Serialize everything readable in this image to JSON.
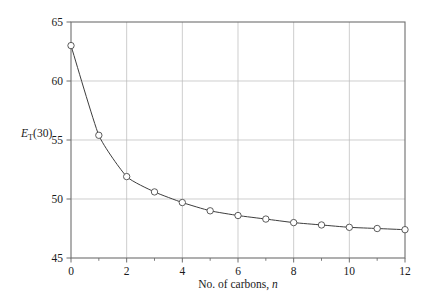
{
  "chart_data": {
    "type": "line",
    "title": "",
    "xlabel": "No. of carbons, n",
    "ylabel": "ET(30)",
    "ylabel_parts": {
      "symbol": "E",
      "subscript": "T",
      "suffix": "(30)"
    },
    "xlabel_parts": {
      "text": "No. of carbons,",
      "italic": "n"
    },
    "x": [
      0,
      1,
      2,
      3,
      4,
      5,
      6,
      7,
      8,
      9,
      10,
      11,
      12
    ],
    "values": [
      63.0,
      55.4,
      51.9,
      50.6,
      49.7,
      49.0,
      48.6,
      48.3,
      48.0,
      47.8,
      47.6,
      47.5,
      47.4
    ],
    "series": [
      {
        "name": "ET(30)",
        "values": [
          63.0,
          55.4,
          51.9,
          50.6,
          49.7,
          49.0,
          48.6,
          48.3,
          48.0,
          47.8,
          47.6,
          47.5,
          47.4
        ]
      }
    ],
    "xlim": [
      0,
      12
    ],
    "ylim": [
      45,
      65
    ],
    "xticks": [
      0,
      2,
      4,
      6,
      8,
      10,
      12
    ],
    "xtick_labels": [
      "0",
      "2",
      "4",
      "6",
      "8",
      "10",
      "12"
    ],
    "xminor_ticks": [
      1,
      3,
      5,
      7,
      9,
      11
    ],
    "yticks": [
      45,
      50,
      55,
      60,
      65
    ],
    "ytick_labels": [
      "45",
      "50",
      "55",
      "60",
      "65"
    ],
    "grid": true,
    "grid_x_values": [
      2,
      4,
      6,
      8,
      10
    ],
    "grid_y_values": [
      50,
      55,
      60
    ],
    "legend": null,
    "marker": "open-circle",
    "colors": {
      "line": "#3d3d3d",
      "marker_stroke": "#4a4a4a",
      "marker_fill": "#ffffff",
      "grid": "#b9b9b9",
      "frame": "#6e6e6e",
      "background": "#ffffff",
      "text": "#1a1a1a"
    }
  }
}
